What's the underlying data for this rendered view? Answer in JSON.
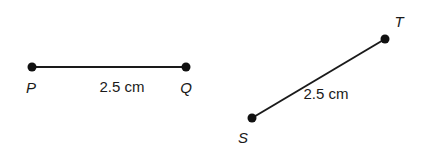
{
  "diagram": {
    "segment_pq": {
      "endpoints": [
        {
          "label": "P",
          "x": 32,
          "y": 67,
          "label_x": 31,
          "label_y": 93
        },
        {
          "label": "Q",
          "x": 186,
          "y": 67,
          "label_x": 186,
          "label_y": 93
        }
      ],
      "length_label": "2.5 cm",
      "length_x": 122,
      "length_y": 92
    },
    "segment_st": {
      "endpoints": [
        {
          "label": "S",
          "x": 252,
          "y": 118,
          "label_x": 243,
          "label_y": 143
        },
        {
          "label": "T",
          "x": 385,
          "y": 39,
          "label_x": 399,
          "label_y": 27
        }
      ],
      "length_label": "2.5 cm",
      "length_x": 326,
      "length_y": 99
    },
    "colors": {
      "line": "#1a1a1a",
      "point": "#111111",
      "text": "#1a1a1a"
    }
  }
}
